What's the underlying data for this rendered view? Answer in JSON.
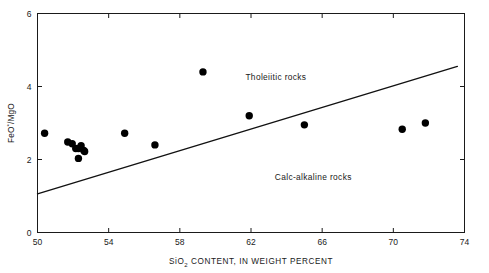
{
  "chart_data": {
    "type": "scatter",
    "title": "",
    "xlabel": "SiO2 CONTENT, IN WEIGHT PERCENT",
    "xlabel_main": "SiO",
    "xlabel_sub": "2",
    "xlabel_rest": "CONTENT, IN WEIGHT PERCENT",
    "ylabel": "FeO*/MgO",
    "ylabel_part1": "FeO",
    "ylabel_sup": "*",
    "ylabel_part2": "/MgO",
    "xlim": [
      50,
      74
    ],
    "ylim": [
      0,
      6
    ],
    "xticks": [
      50,
      54,
      58,
      62,
      66,
      70,
      74
    ],
    "xtick_labels": [
      "50",
      "54",
      "58",
      "62",
      "66",
      "70",
      "74"
    ],
    "yticks": [
      0,
      2,
      4,
      6
    ],
    "ytick_labels": [
      "0",
      "2",
      "4",
      "6"
    ],
    "grid": false,
    "legend_position": "none",
    "marker": "filled-circle",
    "marker_color": "#000000",
    "points": [
      {
        "x": 50.4,
        "y": 2.72
      },
      {
        "x": 51.7,
        "y": 2.48
      },
      {
        "x": 51.95,
        "y": 2.43
      },
      {
        "x": 52.15,
        "y": 2.3
      },
      {
        "x": 52.3,
        "y": 2.3
      },
      {
        "x": 52.45,
        "y": 2.38
      },
      {
        "x": 52.6,
        "y": 2.25
      },
      {
        "x": 52.65,
        "y": 2.22
      },
      {
        "x": 52.3,
        "y": 2.03
      },
      {
        "x": 54.9,
        "y": 2.72
      },
      {
        "x": 56.6,
        "y": 2.4
      },
      {
        "x": 59.3,
        "y": 4.4
      },
      {
        "x": 61.9,
        "y": 3.2
      },
      {
        "x": 65.0,
        "y": 2.95
      },
      {
        "x": 70.5,
        "y": 2.83
      },
      {
        "x": 71.8,
        "y": 3.0
      }
    ],
    "divider": {
      "name": "tholeiitic-calc-alkaline-divider",
      "start": {
        "x": 50.0,
        "y": 1.06
      },
      "end": {
        "x": 73.6,
        "y": 4.55
      }
    },
    "annotations": [
      {
        "name": "tholeiitic-field-label",
        "text": "Tholeiitic rocks",
        "x": 63.4,
        "y": 4.18
      },
      {
        "name": "calc-alkaline-field-label",
        "text": "Calc-alkaline rocks",
        "x": 65.5,
        "y": 1.43
      }
    ]
  }
}
